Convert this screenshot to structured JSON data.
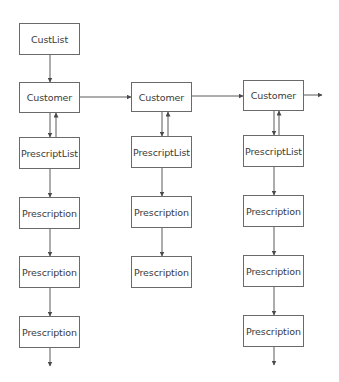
{
  "diagram": {
    "type": "linked-list-structure",
    "line_color": "#5a5a5a",
    "box_border_color": "#6a6a6a",
    "text_color": "#3a3a3a",
    "nodes": {
      "custlist": {
        "label": "CustList",
        "x": 19,
        "y": 23,
        "w": 61,
        "h": 32
      },
      "customer1": {
        "label": "Customer",
        "x": 19,
        "y": 82,
        "w": 61,
        "h": 31
      },
      "customer2": {
        "label": "Customer",
        "x": 131,
        "y": 82,
        "w": 61,
        "h": 30
      },
      "customer3": {
        "label": "Customer",
        "x": 243,
        "y": 80,
        "w": 61,
        "h": 31
      },
      "prescriptlist1": {
        "label": "PrescriptList",
        "x": 19,
        "y": 137,
        "w": 61,
        "h": 32
      },
      "prescriptlist2": {
        "label": "PrescriptList",
        "x": 131,
        "y": 136,
        "w": 61,
        "h": 32
      },
      "prescriptlist3": {
        "label": "PrescriptList",
        "x": 243,
        "y": 135,
        "w": 61,
        "h": 32
      },
      "prescription1a": {
        "label": "Prescription",
        "x": 19,
        "y": 197,
        "w": 61,
        "h": 32
      },
      "prescription2a": {
        "label": "Prescription",
        "x": 131,
        "y": 196,
        "w": 61,
        "h": 32
      },
      "prescription3a": {
        "label": "Prescription",
        "x": 243,
        "y": 195,
        "w": 61,
        "h": 32
      },
      "prescription1b": {
        "label": "Prescription",
        "x": 19,
        "y": 256,
        "w": 61,
        "h": 32
      },
      "prescription2b": {
        "label": "Prescription",
        "x": 131,
        "y": 256,
        "w": 61,
        "h": 32
      },
      "prescription3b": {
        "label": "Prescription",
        "x": 243,
        "y": 255,
        "w": 61,
        "h": 32
      },
      "prescription1c": {
        "label": "Prescription",
        "x": 19,
        "y": 316,
        "w": 61,
        "h": 32
      },
      "prescription3c": {
        "label": "Prescription",
        "x": 243,
        "y": 315,
        "w": 61,
        "h": 32
      }
    },
    "edges": [
      {
        "from": "custlist",
        "to": "customer1",
        "kind": "next"
      },
      {
        "from": "customer1",
        "to": "customer2",
        "kind": "next"
      },
      {
        "from": "customer2",
        "to": "customer3",
        "kind": "next"
      },
      {
        "from": "customer3",
        "to": "(continues)",
        "kind": "next"
      },
      {
        "from": "customer1",
        "to": "prescriptlist1",
        "kind": "bidirectional"
      },
      {
        "from": "customer2",
        "to": "prescriptlist2",
        "kind": "bidirectional"
      },
      {
        "from": "customer3",
        "to": "prescriptlist3",
        "kind": "bidirectional"
      },
      {
        "from": "prescriptlist1",
        "to": "prescription1a",
        "kind": "next"
      },
      {
        "from": "prescription1a",
        "to": "prescription1b",
        "kind": "next"
      },
      {
        "from": "prescription1b",
        "to": "prescription1c",
        "kind": "next"
      },
      {
        "from": "prescription1c",
        "to": "(continues)",
        "kind": "next"
      },
      {
        "from": "prescriptlist2",
        "to": "prescription2a",
        "kind": "next"
      },
      {
        "from": "prescription2a",
        "to": "prescription2b",
        "kind": "next"
      },
      {
        "from": "prescriptlist3",
        "to": "prescription3a",
        "kind": "next"
      },
      {
        "from": "prescription3a",
        "to": "prescription3b",
        "kind": "next"
      },
      {
        "from": "prescription3b",
        "to": "prescription3c",
        "kind": "next"
      },
      {
        "from": "prescription3c",
        "to": "(continues)",
        "kind": "next"
      }
    ]
  }
}
